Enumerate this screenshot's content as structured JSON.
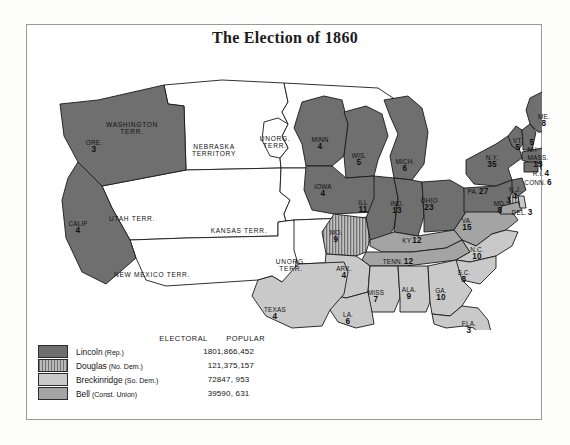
{
  "title": "The Election of 1860",
  "colors": {
    "lincoln": "#6f6f6f",
    "douglas_base": "#b9b9b9",
    "douglas_stripe": "#6f6f6f",
    "breckinridge": "#c9c9c9",
    "bell": "#a4a4a4",
    "territory": "#ffffff",
    "outline": "#1a1a1a",
    "frame": "#9a9a9a",
    "paper": "#fdfdfb"
  },
  "legend": {
    "headers": {
      "electoral": "ELECTORAL",
      "popular": "POPULAR"
    },
    "rows": [
      {
        "key": "lincoln",
        "name": "Lincoln",
        "party": "(Rep.)",
        "electoral": "180",
        "popular": "1,866,452",
        "fill": "solid-dark"
      },
      {
        "key": "douglas",
        "name": "Douglas",
        "party": "(No. Dem.)",
        "electoral": "12",
        "popular": "1,375,157",
        "fill": "striped"
      },
      {
        "key": "breckinridge",
        "name": "Breckinridge",
        "party": "(So. Dem.)",
        "electoral": "72",
        "popular": "847, 953",
        "fill": "solid-light"
      },
      {
        "key": "bell",
        "name": "Bell",
        "party": "(Const. Union)",
        "electoral": "39",
        "popular": "590, 631",
        "fill": "solid-mid"
      }
    ]
  },
  "territories": [
    {
      "id": "washington",
      "name": "WASHINGTON",
      "name2": "TERR.",
      "x": 106,
      "y": 82,
      "w": 76
    },
    {
      "id": "nebraska",
      "name": "NEBRASKA",
      "name2": "TERRITORY",
      "x": 188,
      "y": 104,
      "w": 84
    },
    {
      "id": "utah",
      "name": "UTAH TERR.",
      "name2": "",
      "x": 106,
      "y": 176,
      "w": 76
    },
    {
      "id": "kansas",
      "name": "KANSAS TERR.",
      "name2": "",
      "x": 213,
      "y": 188,
      "w": 82
    },
    {
      "id": "new-mexico",
      "name": "NEW MEXICO TERR.",
      "name2": "",
      "x": 126,
      "y": 232,
      "w": 100
    },
    {
      "id": "unorg-north",
      "name": "UNORG.",
      "name2": "TERR.",
      "x": 249,
      "y": 96,
      "w": 38
    },
    {
      "id": "unorg-south",
      "name": "UNORG.",
      "name2": "TERR.",
      "x": 265,
      "y": 219,
      "w": 38
    }
  ],
  "states": [
    {
      "id": "ore",
      "name": "ORE.",
      "ev": "3",
      "party": "lincoln",
      "x": 68,
      "y": 100,
      "w": 26
    },
    {
      "id": "calif",
      "name": "CALIF",
      "ev": "4",
      "party": "lincoln",
      "x": 52,
      "y": 181,
      "w": 30
    },
    {
      "id": "minn",
      "name": "MINN",
      "ev": "4",
      "party": "lincoln",
      "x": 294,
      "y": 97,
      "w": 28
    },
    {
      "id": "wis",
      "name": "WIS.",
      "ev": "5",
      "party": "lincoln",
      "x": 333,
      "y": 113,
      "w": 24
    },
    {
      "id": "mich",
      "name": "MICH.",
      "ev": "6",
      "party": "lincoln",
      "x": 379,
      "y": 119,
      "w": 28
    },
    {
      "id": "iowa",
      "name": "IOWA",
      "ev": "4",
      "party": "lincoln",
      "x": 297,
      "y": 144,
      "w": 28
    },
    {
      "id": "ill",
      "name": "ILL",
      "ev": "11",
      "party": "lincoln",
      "x": 337,
      "y": 160,
      "w": 22
    },
    {
      "id": "ind",
      "name": "IND.",
      "ev": "13",
      "party": "lincoln",
      "x": 371,
      "y": 161,
      "w": 24
    },
    {
      "id": "ohio",
      "name": "OHIO",
      "ev": "23",
      "party": "lincoln",
      "x": 403,
      "y": 158,
      "w": 28
    },
    {
      "id": "ny",
      "name": "N.Y.",
      "ev": "35",
      "party": "lincoln",
      "x": 466,
      "y": 115,
      "w": 26
    },
    {
      "id": "pa",
      "name": "PA.",
      "ev": "27",
      "party": "lincoln",
      "x": 452,
      "y": 148,
      "w": 40,
      "inline": true
    },
    {
      "id": "vt",
      "name": "VT.",
      "ev": "5",
      "party": "lincoln",
      "x": 492,
      "y": 98,
      "w": 18
    },
    {
      "id": "nh",
      "name": "NH",
      "ev": "5",
      "party": "lincoln",
      "x": 506,
      "y": 100,
      "w": 18,
      "reverse": true
    },
    {
      "id": "me",
      "name": "ME.",
      "ev": "8",
      "party": "lincoln",
      "x": 518,
      "y": 74,
      "w": 20
    },
    {
      "id": "mass",
      "name": "MASS.",
      "ev": "13",
      "party": "lincoln",
      "x": 512,
      "y": 115,
      "w": 32
    },
    {
      "id": "ri",
      "name": "R.I.",
      "ev": "4",
      "party": "lincoln",
      "x": 515,
      "y": 130,
      "w": 28,
      "inline": true
    },
    {
      "id": "conn",
      "name": "CONN.",
      "ev": "6",
      "party": "lincoln",
      "x": 512,
      "y": 139,
      "w": 36,
      "inline": true
    },
    {
      "id": "nj",
      "name": "N.J.",
      "ev": "4",
      "party": "lincoln",
      "x": 489,
      "y": 147,
      "w": 14
    },
    {
      "id": "nj2",
      "name": "",
      "ev": "3",
      "party": "douglas",
      "x": 483,
      "y": 158,
      "w": 10
    },
    {
      "id": "del",
      "name": "DEL.",
      "ev": "3",
      "party": "breckinridge",
      "x": 496,
      "y": 169,
      "w": 30,
      "inline": true
    },
    {
      "id": "md",
      "name": "MD.",
      "ev": "8",
      "party": "bell",
      "x": 474,
      "y": 161,
      "w": 18
    },
    {
      "id": "mo",
      "name": "MO.",
      "ev": "9",
      "party": "douglas",
      "x": 310,
      "y": 190,
      "w": 24
    },
    {
      "id": "va",
      "name": "VA.",
      "ev": "15",
      "party": "bell",
      "x": 441,
      "y": 178,
      "w": 22
    },
    {
      "id": "ky",
      "name": "KY",
      "ev": "12",
      "party": "bell",
      "x": 386,
      "y": 197,
      "w": 32,
      "inline": true
    },
    {
      "id": "tenn",
      "name": "TENN.",
      "ev": "12",
      "party": "bell",
      "x": 372,
      "y": 218,
      "w": 42,
      "inline": true
    },
    {
      "id": "nc",
      "name": "N.C.",
      "ev": "10",
      "party": "breckinridge",
      "x": 451,
      "y": 207,
      "w": 24
    },
    {
      "id": "sc",
      "name": "S.C.",
      "ev": "8",
      "party": "breckinridge",
      "x": 438,
      "y": 230,
      "w": 22
    },
    {
      "id": "ark",
      "name": "ARK.",
      "ev": "4",
      "party": "breckinridge",
      "x": 318,
      "y": 226,
      "w": 26
    },
    {
      "id": "miss",
      "name": "MISS",
      "ev": "7",
      "party": "breckinridge",
      "x": 350,
      "y": 250,
      "w": 26
    },
    {
      "id": "ala",
      "name": "ALA.",
      "ev": "9",
      "party": "breckinridge",
      "x": 383,
      "y": 247,
      "w": 24
    },
    {
      "id": "ga",
      "name": "GA.",
      "ev": "10",
      "party": "breckinridge",
      "x": 415,
      "y": 248,
      "w": 24
    },
    {
      "id": "la",
      "name": "LA.",
      "ev": "6",
      "party": "breckinridge",
      "x": 322,
      "y": 272,
      "w": 20
    },
    {
      "id": "texas",
      "name": "TEXAS",
      "ev": "4",
      "party": "breckinridge",
      "x": 249,
      "y": 267,
      "w": 32
    },
    {
      "id": "fla",
      "name": "FLA.",
      "ev": "3",
      "party": "breckinridge",
      "x": 443,
      "y": 281,
      "w": 22
    }
  ]
}
